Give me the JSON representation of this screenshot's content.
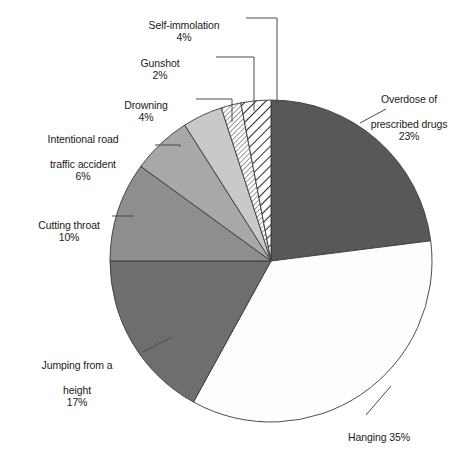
{
  "chart_data": {
    "type": "pie",
    "title": "",
    "subtitle": "",
    "xlabel": "",
    "ylabel": "",
    "legend_position": "none",
    "labels_position": "outside-with-leader-lines",
    "grid": false,
    "unit": "%",
    "total": 101,
    "categories": [
      "Overdose of prescribed drugs",
      "Hanging",
      "Jumping from a height",
      "Cutting throat",
      "Intentional road traffic accident",
      "Drowning",
      "Gunshot",
      "Self-immolation"
    ],
    "values": [
      23,
      35,
      17,
      10,
      6,
      4,
      2,
      4
    ],
    "slices": [
      {
        "name": "Overdose of prescribed drugs",
        "label": "Overdose of\nprescribed drugs",
        "percent_text": "23%",
        "value": 23,
        "fill": "#585858",
        "pattern": "solid",
        "start_angle": 0,
        "end_angle": 82.8
      },
      {
        "name": "Hanging",
        "label": "Hanging 35%",
        "percent_text": "35%",
        "value": 35,
        "fill": "#fdfdfb",
        "pattern": "solid",
        "start_angle": 82.8,
        "end_angle": 208.8
      },
      {
        "name": "Jumping from a height",
        "label": "Jumping from a\nheight",
        "percent_text": "17%",
        "value": 17,
        "fill": "#6e6e6e",
        "pattern": "solid",
        "start_angle": 208.8,
        "end_angle": 270.0
      },
      {
        "name": "Cutting throat",
        "label": "Cutting throat",
        "percent_text": "10%",
        "value": 10,
        "fill": "#8e8e8e",
        "pattern": "solid",
        "start_angle": 270.0,
        "end_angle": 306.0
      },
      {
        "name": "Intentional road traffic accident",
        "label": "Intentional road\ntraffic accident",
        "percent_text": "6%",
        "value": 6,
        "fill": "#a8a8a8",
        "pattern": "solid",
        "start_angle": 306.0,
        "end_angle": 327.6
      },
      {
        "name": "Drowning",
        "label": "Drowning",
        "percent_text": "4%",
        "value": 4,
        "fill": "#c9c9c9",
        "pattern": "solid",
        "start_angle": 327.6,
        "end_angle": 342.0
      },
      {
        "name": "Gunshot",
        "label": "Gunshot",
        "percent_text": "2%",
        "value": 2,
        "fill": "#ffffff",
        "pattern": "fine-diagonal-hatch",
        "start_angle": 342.0,
        "end_angle": 349.2
      },
      {
        "name": "Self-immolation",
        "label": "Self-immolation",
        "percent_text": "4%",
        "value": 4,
        "fill": "#ffffff",
        "pattern": "bold-diagonal-hatch",
        "start_angle": 349.2,
        "end_angle": 360.0
      }
    ],
    "geometry": {
      "center_x": 271,
      "center_y": 261,
      "radius": 161
    },
    "colors": {
      "outline": "#3a3a3a",
      "leader_line": "#5a5a5a",
      "text": "#1a1a1a",
      "background": "#ffffff"
    }
  },
  "labels": {
    "self_immolation": {
      "name": "Self-immolation",
      "percent": "4%"
    },
    "gunshot": {
      "name": "Gunshot",
      "percent": "2%"
    },
    "drowning": {
      "name": "Drowning",
      "percent": "4%"
    },
    "road_traffic": {
      "line1": "Intentional road",
      "line2": "traffic accident",
      "percent": "6%"
    },
    "cutting_throat": {
      "name": "Cutting throat",
      "percent": "10%"
    },
    "jumping": {
      "line1": "Jumping from a",
      "line2": "height",
      "percent": "17%"
    },
    "overdose": {
      "line1": "Overdose of",
      "line2": "prescribed drugs",
      "percent": "23%"
    },
    "hanging": {
      "name": "Hanging 35%"
    }
  },
  "caption": {
    "text": ""
  }
}
